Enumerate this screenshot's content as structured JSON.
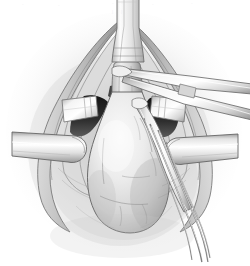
{
  "figure": {
    "domain": "medical-illustration",
    "medium": "grayscale pen-and-wash anatomical line drawing",
    "background_color": "#ffffff",
    "canvas": {
      "width": 250,
      "height": 266
    }
  },
  "palette": {
    "background": "#ffffff",
    "paper_shadow": "#d8d8d8",
    "halo_outer": "#efefef",
    "halo_inner": "#c9c9c9",
    "organ_light": "#f2f2f2",
    "organ_mid": "#d3d3d3",
    "organ_shade": "#9e9e9e",
    "tissue_light": "#ededed",
    "tissue_mid": "#c4c4c4",
    "tissue_dark": "#8a8a8a",
    "cavity_dark": "#3a3a3a",
    "cavity_black": "#1d1d1d",
    "metal_light": "#fbfbfb",
    "metal_mid": "#dcdcdc",
    "metal_shade": "#a8a8a8",
    "outline": "#4a4a4a",
    "outline_soft": "#8d8d8d",
    "hairline": "#6f6f6f"
  },
  "scene": {
    "view_label": "operative field, superior-to-inferior view",
    "elements": [
      {
        "id": "vertical-tube",
        "name": "urethral-catheter-tube",
        "label": "Catheter / tubular structure entering field from above",
        "position": "top-center"
      },
      {
        "id": "wound-halo",
        "name": "soft-tissue-halo",
        "label": "Diffuse shading around the incision",
        "position": "full-field"
      },
      {
        "id": "incision-margin-left",
        "name": "incision-margin-left",
        "label": "Left divided tissue margin",
        "position": "left"
      },
      {
        "id": "incision-margin-right",
        "name": "incision-margin-right",
        "label": "Right divided tissue margin",
        "position": "right"
      },
      {
        "id": "cavity-left",
        "name": "cavity-shadow-left",
        "label": "Deep shadowed recess, left",
        "position": "upper-left-center"
      },
      {
        "id": "cavity-right",
        "name": "cavity-shadow-right",
        "label": "Deep shadowed recess, right",
        "position": "upper-right-center"
      },
      {
        "id": "organ-body",
        "name": "bladder-organ-body",
        "label": "Large pear-shaped organ (bladder) in the center of the field",
        "position": "center-lower"
      },
      {
        "id": "organ-neck",
        "name": "organ-neck",
        "label": "Narrow neck of the organ passing superiorly",
        "position": "center-upper"
      },
      {
        "id": "retractor-left",
        "name": "retractor-blade-left",
        "label": "Flat ribbon retractor blade, left",
        "position": "left-middle"
      },
      {
        "id": "retractor-right",
        "name": "retractor-blade-right",
        "label": "Flat ribbon retractor blade, right",
        "position": "right-middle"
      },
      {
        "id": "retractor-upper-left",
        "name": "retractor-blade-upper-left",
        "label": "Small square retractor blade, upper left",
        "position": "upper-left"
      },
      {
        "id": "retractor-upper-right",
        "name": "retractor-blade-upper-right",
        "label": "Small square retractor blade, upper right",
        "position": "upper-right"
      },
      {
        "id": "forceps-upper",
        "name": "forceps-upper-right",
        "label": "Long forceps entering from upper right, tip at center top",
        "position": "upper-right-diagonal"
      },
      {
        "id": "forceps-lower",
        "name": "dissector-lower-right",
        "label": "Dissecting instrument angled down to the lower right",
        "position": "center-to-lower-right"
      },
      {
        "id": "suture-strands",
        "name": "suture-strands",
        "label": "Fine suture / instrument shafts trailing to the lower right",
        "position": "lower-right"
      },
      {
        "id": "vessel-marks",
        "name": "surface-vessel-marks",
        "label": "Fine vascular markings on the organ surface",
        "position": "organ-surface"
      }
    ]
  },
  "annotations": {
    "visible_text": [],
    "caption": "",
    "labels": [],
    "leader_lines": []
  },
  "scan_artifacts": {
    "note": "Very faint residual marks along the top edge of the scan; not legible text.",
    "marks": [
      {
        "text": "·",
        "x": 22,
        "y": 2
      },
      {
        "text": "·",
        "x": 58,
        "y": 3
      },
      {
        "text": "·",
        "x": 112,
        "y": 1
      },
      {
        "text": "·",
        "x": 121,
        "y": 1
      },
      {
        "text": "·",
        "x": 152,
        "y": 2
      },
      {
        "text": "·",
        "x": 191,
        "y": 1
      },
      {
        "text": "|",
        "x": 112,
        "y": 9
      },
      {
        "text": "|",
        "x": 121,
        "y": 9
      }
    ]
  }
}
